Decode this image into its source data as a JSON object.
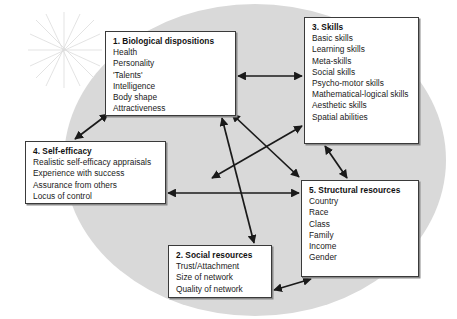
{
  "diagram": {
    "background_shape": "ellipse",
    "background_color": "#d9d9d9",
    "page_color": "#ffffff",
    "box_border_color": "#3a3a3a",
    "arrow_color": "#1a1a1a",
    "boxes": [
      {
        "id": "box-1",
        "title": "1. Biological dispositions",
        "items": [
          "Health",
          "Personality",
          "'Talents'",
          "Intelligence",
          "Body shape",
          "Attractiveness"
        ]
      },
      {
        "id": "box-2",
        "title": "2. Social resources",
        "items": [
          "Trust/Attachment",
          "Size of network",
          "Quality of network"
        ]
      },
      {
        "id": "box-3",
        "title": "3. Skills",
        "items": [
          "Basic skills",
          "Learning skills",
          "Meta-skills",
          "Social skills",
          "Psycho-motor skills",
          "Mathematical-logical skills",
          "Aesthetic skills",
          "Spatial abilities"
        ]
      },
      {
        "id": "box-4",
        "title": "4. Self-efficacy",
        "items": [
          "Realistic self-efficacy appraisals",
          "Experience with success",
          "Assurance from others",
          "Locus of control"
        ]
      },
      {
        "id": "box-5",
        "title": "5. Structural resources",
        "items": [
          "Country",
          "Race",
          "Class",
          "Family",
          "Income",
          "Gender"
        ]
      }
    ],
    "connections": [
      {
        "name": "arrow-box1-box3",
        "from": "box-1",
        "to": "box-3",
        "style": "double-headed",
        "x1": 238,
        "y1": 76,
        "x2": 302,
        "y2": 76
      },
      {
        "name": "arrow-box1-box4",
        "from": "box-1",
        "to": "box-4",
        "style": "double-headed",
        "x1": 108,
        "y1": 114,
        "x2": 75,
        "y2": 139
      },
      {
        "name": "arrow-box1-box2",
        "from": "box-1",
        "to": "box-2",
        "style": "double-headed",
        "x1": 222,
        "y1": 118,
        "x2": 254,
        "y2": 243
      },
      {
        "name": "arrow-box4-box3",
        "from": "box-4",
        "to": "box-3",
        "style": "double-headed",
        "x1": 212,
        "y1": 178,
        "x2": 302,
        "y2": 126
      },
      {
        "name": "arrow-box5-box1",
        "from": "box-5",
        "to": "box-1",
        "style": "double-headed",
        "x1": 232,
        "y1": 114,
        "x2": 299,
        "y2": 177
      },
      {
        "name": "arrow-box4-box5",
        "from": "box-4",
        "to": "box-5",
        "style": "double-headed",
        "x1": 168,
        "y1": 193,
        "x2": 299,
        "y2": 193
      },
      {
        "name": "arrow-box3-box5",
        "from": "box-3",
        "to": "box-5",
        "style": "double-headed",
        "x1": 325,
        "y1": 146,
        "x2": 347,
        "y2": 178
      },
      {
        "name": "arrow-box2-box5",
        "from": "box-2",
        "to": "box-5",
        "style": "double-headed",
        "x1": 274,
        "y1": 290,
        "x2": 311,
        "y2": 279
      }
    ]
  }
}
